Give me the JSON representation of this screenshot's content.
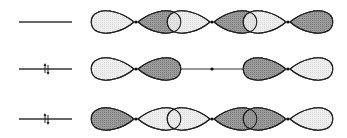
{
  "diagram": {
    "type": "molecular-orbital-diagram",
    "colors": {
      "shaded_lobe": "#8f8f8f",
      "light_lobe": "#e6e6e6",
      "outline": "#222222",
      "line": "#333333"
    },
    "atoms_x": [
      136,
      212,
      288
    ],
    "orbitals": [
      {
        "level_y": 22,
        "electrons": 0,
        "lobes": [
          {
            "atom": 0,
            "dir": "left",
            "shade": "light"
          },
          {
            "atom": 0,
            "dir": "right",
            "shade": "dark"
          },
          {
            "atom": 1,
            "dir": "left",
            "shade": "light"
          },
          {
            "atom": 1,
            "dir": "right",
            "shade": "dark"
          },
          {
            "atom": 2,
            "dir": "left",
            "shade": "light"
          },
          {
            "atom": 2,
            "dir": "right",
            "shade": "dark"
          }
        ],
        "center_bond": false
      },
      {
        "level_y": 69,
        "electrons": 2,
        "lobes": [
          {
            "atom": 0,
            "dir": "left",
            "shade": "light"
          },
          {
            "atom": 0,
            "dir": "right",
            "shade": "dark"
          },
          {
            "atom": 2,
            "dir": "left",
            "shade": "dark"
          },
          {
            "atom": 2,
            "dir": "right",
            "shade": "light"
          }
        ],
        "center_bond": true
      },
      {
        "level_y": 119,
        "electrons": 2,
        "lobes": [
          {
            "atom": 0,
            "dir": "left",
            "shade": "dark"
          },
          {
            "atom": 0,
            "dir": "right",
            "shade": "light"
          },
          {
            "atom": 1,
            "dir": "left",
            "shade": "light"
          },
          {
            "atom": 1,
            "dir": "right",
            "shade": "dark"
          },
          {
            "atom": 2,
            "dir": "left",
            "shade": "dark"
          },
          {
            "atom": 2,
            "dir": "right",
            "shade": "light"
          }
        ],
        "center_bond": false
      }
    ]
  }
}
